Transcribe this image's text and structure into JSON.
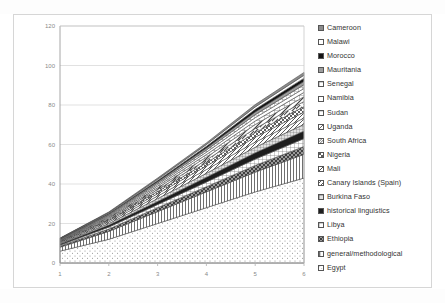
{
  "chart_data": {
    "type": "area",
    "stacked": true,
    "title": "",
    "xlabel": "",
    "ylabel": "",
    "x": [
      1,
      2,
      3,
      4,
      5,
      6
    ],
    "xticks": [
      "1",
      "2",
      "3",
      "4",
      "5",
      "6"
    ],
    "yticks": [
      "0",
      "20",
      "40",
      "60",
      "80",
      "100",
      "120"
    ],
    "ylim": [
      0,
      120
    ],
    "xlim": [
      1,
      6
    ],
    "grid": "horizontal",
    "legend_position": "right",
    "totals": [
      12,
      24,
      40,
      58,
      80,
      98
    ],
    "series": [
      {
        "name": "Egypt",
        "pattern": "dots-sparse",
        "color": "#ffffff",
        "values": [
          6,
          12,
          20,
          28,
          36,
          43
        ]
      },
      {
        "name": "general/methodological",
        "pattern": "vertical-lines",
        "color": "#e8e8e8",
        "values": [
          2,
          4,
          6,
          8,
          10,
          12
        ]
      },
      {
        "name": "Ethiopia",
        "pattern": "diagonal-cross",
        "color": "#9a9a9a",
        "values": [
          0.6,
          1.2,
          2,
          2.6,
          3.4,
          4
        ]
      },
      {
        "name": "Libya",
        "pattern": "grid-lines",
        "color": "#d0d0d0",
        "values": [
          0.5,
          1,
          1.6,
          2.4,
          3.2,
          4
        ]
      },
      {
        "name": "historical linguistics",
        "pattern": "solid-dark",
        "color": "#1e1e1e",
        "values": [
          0.5,
          1,
          1.6,
          2.4,
          3.2,
          3.8
        ]
      },
      {
        "name": "Burkina Faso",
        "pattern": "grid-fine",
        "color": "#bdbdbd",
        "values": [
          0.4,
          0.8,
          1.4,
          2,
          2.8,
          3.4
        ]
      },
      {
        "name": "Canary Islands (Spain)",
        "pattern": "diagonal-up",
        "color": "#c9c9c9",
        "values": [
          0.4,
          0.8,
          1.3,
          1.9,
          2.6,
          3.2
        ]
      },
      {
        "name": "Mali",
        "pattern": "diagonal-down",
        "color": "#a8a8a8",
        "values": [
          0.3,
          0.7,
          1.2,
          1.8,
          2.5,
          3.0
        ]
      },
      {
        "name": "Nigeria",
        "pattern": "checker",
        "color": "#8f8f8f",
        "values": [
          0.3,
          0.6,
          1.1,
          1.6,
          2.3,
          2.8
        ]
      },
      {
        "name": "South Africa",
        "pattern": "diagonal-up-wide",
        "color": "#b5b5b5",
        "values": [
          0.3,
          0.6,
          1.0,
          1.5,
          2.1,
          2.6
        ]
      },
      {
        "name": "Uganda",
        "pattern": "diagonal-down-wd",
        "color": "#999999",
        "values": [
          0.2,
          0.5,
          0.9,
          1.4,
          2.0,
          2.4
        ]
      },
      {
        "name": "Sudan",
        "pattern": "grid-coarse",
        "color": "#cfcfcf",
        "values": [
          0.2,
          0.5,
          0.9,
          1.3,
          1.8,
          2.2
        ]
      },
      {
        "name": "Namibia",
        "pattern": "plain-white",
        "color": "#ffffff",
        "values": [
          0.2,
          0.4,
          0.8,
          1.2,
          1.7,
          2.0
        ]
      },
      {
        "name": "Senegal",
        "pattern": "grid-lines",
        "color": "#dadada",
        "values": [
          0.2,
          0.4,
          0.7,
          1.1,
          1.5,
          1.9
        ]
      },
      {
        "name": "Mauritania",
        "pattern": "solid-mid",
        "color": "#9e9e9e",
        "values": [
          0.2,
          0.4,
          0.7,
          1.0,
          1.4,
          1.7
        ]
      },
      {
        "name": "Morocco",
        "pattern": "solid-black",
        "color": "#141414",
        "values": [
          0.1,
          0.35,
          0.6,
          0.9,
          1.3,
          1.6
        ]
      },
      {
        "name": "Malawi",
        "pattern": "plain-white",
        "color": "#ffffff",
        "values": [
          0.1,
          0.3,
          0.6,
          0.9,
          1.2,
          1.5
        ]
      },
      {
        "name": "Cameroon",
        "pattern": "solid-mid2",
        "color": "#8c8c8c",
        "values": [
          0.1,
          0.3,
          0.6,
          0.8,
          1.2,
          1.4
        ]
      }
    ]
  },
  "legend": {
    "items": [
      {
        "label": "Cameroon",
        "swatch": "solid-mid2"
      },
      {
        "label": "Malawi",
        "swatch": "plain-white"
      },
      {
        "label": "Morocco",
        "swatch": "solid-black"
      },
      {
        "label": "Mauritania",
        "swatch": "solid-mid"
      },
      {
        "label": "Senegal",
        "swatch": "grid-lines"
      },
      {
        "label": "Namibia",
        "swatch": "plain-white"
      },
      {
        "label": "Sudan",
        "swatch": "grid-coarse"
      },
      {
        "label": "Uganda",
        "swatch": "diagonal-down-wd"
      },
      {
        "label": "South Africa",
        "swatch": "diagonal-up-wide"
      },
      {
        "label": "Nigeria",
        "swatch": "checker"
      },
      {
        "label": "Mali",
        "swatch": "diagonal-down"
      },
      {
        "label": "Canary Islands (Spain)",
        "swatch": "diagonal-up"
      },
      {
        "label": "Burkina Faso",
        "swatch": "grid-fine"
      },
      {
        "label": "historical linguistics",
        "swatch": "solid-dark"
      },
      {
        "label": "Libya",
        "swatch": "grid-lines"
      },
      {
        "label": "Ethiopia",
        "swatch": "diagonal-cross"
      },
      {
        "label": "general/methodological",
        "swatch": "vertical-lines"
      },
      {
        "label": "Egypt",
        "swatch": "dots-sparse"
      }
    ]
  },
  "colors": {
    "grid": "#d9d9d9",
    "axis_text": "#8a8a8a",
    "card_border": "#d6d6d6",
    "plot_border": "#9c9c9c"
  }
}
